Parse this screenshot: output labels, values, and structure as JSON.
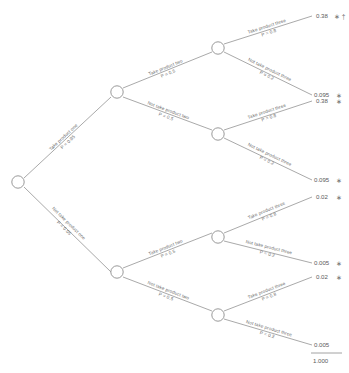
{
  "diagram": {
    "type": "probability-decision-tree",
    "title": "",
    "root": {
      "label": ""
    },
    "levels": [
      {
        "level": 1,
        "decision": "product one"
      },
      {
        "level": 2,
        "decision": "product two"
      },
      {
        "level": 3,
        "decision": "product three"
      }
    ],
    "branch_labels": {
      "take_one": "Take product one",
      "not_take_one": "Not take product one",
      "take_two": "Take product two",
      "not_take_two": "Not take product two",
      "take_three": "Take product three",
      "not_take_three": "Not take product three"
    },
    "branch_probs": {
      "take_one": "P = 0.95",
      "not_take_one": "P = 0.05",
      "take_two": "P = 0.5",
      "not_take_two": "P = 0.5",
      "take_three": "P = 0.8",
      "not_take_three": "P = 0.2"
    },
    "leaves": [
      {
        "value": "0.38",
        "marks": "∗ †",
        "asterisk": "∗",
        "dagger": "†"
      },
      {
        "value": "0.095",
        "marks": "∗"
      },
      {
        "value": "0.38",
        "marks": "∗"
      },
      {
        "value": "0.095",
        "marks": "∗"
      },
      {
        "value": "0.02",
        "marks": "∗"
      },
      {
        "value": "0.005",
        "marks": "∗"
      },
      {
        "value": "0.02",
        "marks": "∗"
      },
      {
        "value": "0.005",
        "marks": ""
      }
    ],
    "total": {
      "value": "1.000"
    }
  }
}
